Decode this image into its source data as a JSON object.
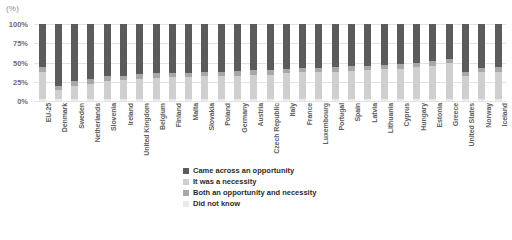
{
  "unit_label": "(%)",
  "chart_data": {
    "type": "bar",
    "subtype": "stacked-100-percent",
    "title": "",
    "xlabel": "",
    "ylabel": "(%)",
    "ylim": [
      0,
      100
    ],
    "ytick_labels": [
      "100%",
      "75%",
      "50%",
      "25%",
      "0%"
    ],
    "ytick_values": [
      100,
      75,
      50,
      25,
      0
    ],
    "grid": true,
    "legend_position": "bottom-center",
    "categories": [
      "EU-25",
      "Denmark",
      "Sweden",
      "Netherlands",
      "Slovenia",
      "Ireland",
      "United Kingdom",
      "Belgium",
      "Finland",
      "Malta",
      "Slovakia",
      "Poland",
      "Germany",
      "Austria",
      "Czech Republic",
      "Italy",
      "France",
      "Luxembourg",
      "Portugal",
      "Spain",
      "Latvia",
      "Lithuania",
      "Cyprus",
      "Hungary",
      "Estonia",
      "Greece",
      "United States",
      "Norway",
      "Iceland"
    ],
    "series": [
      {
        "name": "Came across an opportunity",
        "color": "#5b5b5b",
        "values": [
          56,
          81,
          74,
          72,
          68,
          67,
          65,
          64,
          63,
          63,
          62,
          62,
          61,
          60,
          60,
          58,
          57,
          57,
          56,
          55,
          54,
          53,
          52,
          50,
          48,
          45,
          62,
          57,
          56
        ]
      },
      {
        "name": "It was a necessity",
        "color": "#cfcfcf",
        "values": [
          34,
          12,
          18,
          20,
          24,
          25,
          27,
          28,
          29,
          29,
          30,
          30,
          31,
          32,
          32,
          34,
          35,
          35,
          36,
          37,
          38,
          39,
          40,
          42,
          44,
          47,
          30,
          35,
          36
        ]
      },
      {
        "name": "Both an opportunity and necessity",
        "color": "#a8a8a8",
        "values": [
          7,
          5,
          6,
          6,
          6,
          6,
          6,
          6,
          6,
          6,
          6,
          6,
          6,
          6,
          6,
          6,
          6,
          6,
          6,
          6,
          6,
          6,
          6,
          6,
          6,
          6,
          6,
          6,
          6
        ]
      },
      {
        "name": "Did not know",
        "color": "#ebebeb",
        "values": [
          3,
          2,
          2,
          2,
          2,
          2,
          2,
          2,
          2,
          2,
          2,
          2,
          2,
          2,
          2,
          2,
          2,
          2,
          2,
          2,
          2,
          2,
          2,
          2,
          2,
          2,
          2,
          2,
          2
        ]
      }
    ]
  },
  "legend": [
    {
      "label": "Came across an opportunity",
      "color": "#5b5b5b"
    },
    {
      "label": "It was a necessity",
      "color": "#cfcfcf"
    },
    {
      "label": "Both an opportunity and necessity",
      "color": "#a8a8a8"
    },
    {
      "label": "Did not know",
      "color": "#ebebeb"
    }
  ]
}
